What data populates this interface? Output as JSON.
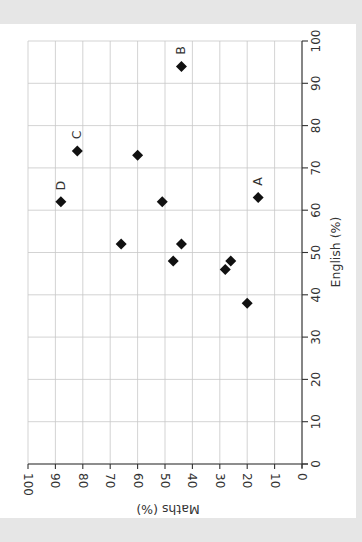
{
  "chart_data": {
    "type": "scatter",
    "title": "",
    "orientation_note": "figure rotated 90 degrees clockwise",
    "xlabel": "English (%)",
    "ylabel": "Maths (%)",
    "xlim": [
      0,
      100
    ],
    "ylim": [
      0,
      100
    ],
    "xticks": [
      0,
      10,
      20,
      30,
      40,
      50,
      60,
      70,
      80,
      90,
      100
    ],
    "yticks": [
      0,
      10,
      20,
      30,
      40,
      50,
      60,
      70,
      80,
      90,
      100
    ],
    "grid": true,
    "marker": "diamond",
    "points": [
      {
        "english": 94,
        "maths": 44,
        "label": "B"
      },
      {
        "english": 74,
        "maths": 82,
        "label": "C"
      },
      {
        "english": 73,
        "maths": 60,
        "label": ""
      },
      {
        "english": 62,
        "maths": 88,
        "label": "D"
      },
      {
        "english": 62,
        "maths": 51,
        "label": ""
      },
      {
        "english": 63,
        "maths": 16,
        "label": "A"
      },
      {
        "english": 52,
        "maths": 66,
        "label": ""
      },
      {
        "english": 52,
        "maths": 44,
        "label": ""
      },
      {
        "english": 48,
        "maths": 47,
        "label": ""
      },
      {
        "english": 48,
        "maths": 26,
        "label": ""
      },
      {
        "english": 46,
        "maths": 28,
        "label": ""
      },
      {
        "english": 38,
        "maths": 20,
        "label": ""
      }
    ]
  },
  "labels": {
    "english_axis": "English (%)",
    "maths_axis": "Maths (%)"
  },
  "colors": {
    "marker": "#111111",
    "grid": "#c8c8c8",
    "axis": "#333333",
    "background": "#ffffff",
    "border": "#e6e6e6"
  }
}
